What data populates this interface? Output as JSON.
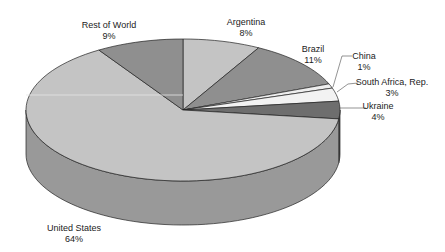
{
  "chart_data": {
    "type": "pie",
    "style": "3d",
    "title": "",
    "legend": "none",
    "start_angle_deg": 0,
    "direction": "clockwise",
    "categories": [
      "Argentina",
      "Brazil",
      "China",
      "South Africa, Rep.",
      "Ukraine",
      "United States",
      "Rest of World"
    ],
    "values": [
      8,
      11,
      1,
      3,
      4,
      64,
      9
    ],
    "value_labels": [
      "8%",
      "11%",
      "1%",
      "3%",
      "4%",
      "64%",
      "9%"
    ],
    "colors": [
      "#c4c4c4",
      "#8f8f8f",
      "#eeeeee",
      "#f2f2f2",
      "#6e6e6e",
      "#c4c4c4",
      "#8f8f8f"
    ],
    "side_colors": [
      "#9a9a9a",
      "#6e6e6e",
      "#bdbdbd",
      "#c8c8c8",
      "#505050",
      "#999999",
      "#6e6e6e"
    ]
  },
  "labels": [
    {
      "name": "Argentina",
      "pct": "8%",
      "x": 246,
      "y": 17
    },
    {
      "name": "Brazil",
      "pct": "11%",
      "x": 313,
      "y": 44
    },
    {
      "name": "China",
      "pct": "1%",
      "x": 364,
      "y": 51
    },
    {
      "name": "South Africa, Rep.",
      "pct": "3%",
      "x": 392,
      "y": 77
    },
    {
      "name": "Ukraine",
      "pct": "4%",
      "x": 378,
      "y": 101
    },
    {
      "name": "United States",
      "pct": "64%",
      "x": 74,
      "y": 223
    },
    {
      "name": "Rest of World",
      "pct": "9%",
      "x": 109,
      "y": 20
    }
  ]
}
